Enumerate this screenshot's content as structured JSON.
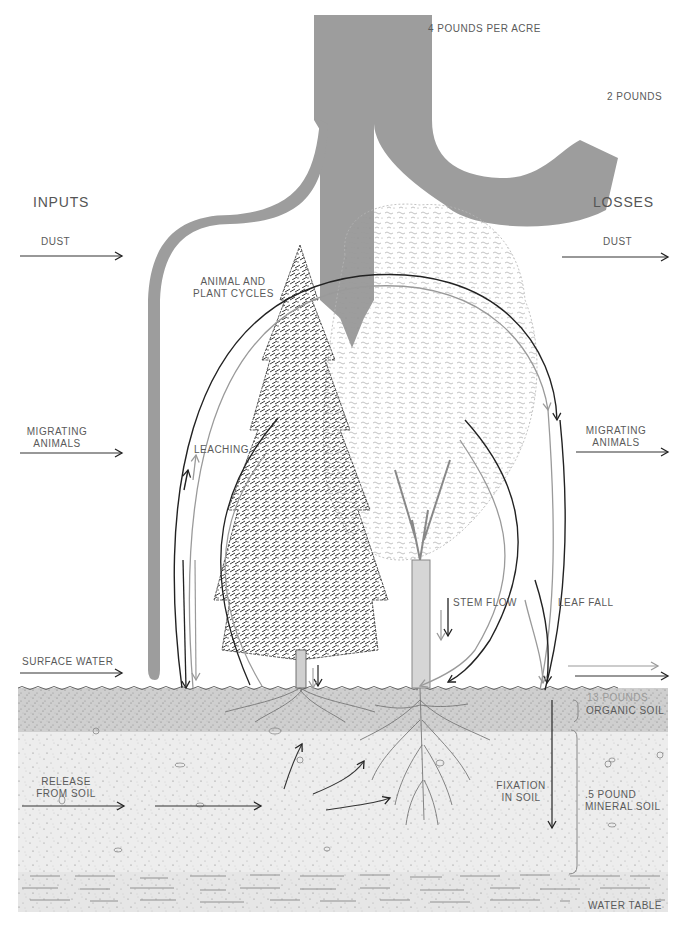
{
  "diagram": {
    "colors": {
      "flow_gray": "#9d9d9d",
      "line_black": "#222222",
      "line_gray": "#9a9a9a",
      "organic_soil": "#cfcfcf",
      "mineral_soil": "#ececec",
      "water_table": "#e4e4e4"
    },
    "top_flow": {
      "main_label": "4 POUNDS PER ACRE",
      "side_label": "2 POUNDS"
    },
    "inputs": {
      "heading": "INPUTS",
      "items": [
        {
          "label": "DUST"
        },
        {
          "label_line1": "MIGRATING",
          "label_line2": "ANIMALS"
        },
        {
          "label": "SURFACE WATER"
        },
        {
          "label_line1": "RELEASE",
          "label_line2": "FROM SOIL"
        }
      ]
    },
    "losses": {
      "heading": "LOSSES",
      "items": [
        {
          "label": "DUST"
        },
        {
          "label_line1": "MIGRATING",
          "label_line2": "ANIMALS"
        }
      ]
    },
    "cycles": {
      "animal_plant_line1": "ANIMAL AND",
      "animal_plant_line2": "PLANT CYCLES",
      "leaching": "LEACHING",
      "stem_flow": "STEM FLOW",
      "leaf_fall": "LEAF FALL",
      "fixation_line1": "FIXATION",
      "fixation_line2": "IN SOIL"
    },
    "soil": {
      "organic_amount": "13 POUNDS",
      "organic_label": "ORGANIC SOIL",
      "mineral_amount": ".5 POUND",
      "mineral_label": "MINERAL SOIL",
      "water_table": "WATER TABLE"
    },
    "icons": [
      "arrow-right-icon",
      "arrow-down-icon",
      "conifer-tree-icon",
      "deciduous-tree-icon",
      "roots-icon",
      "bracket-icon"
    ]
  }
}
